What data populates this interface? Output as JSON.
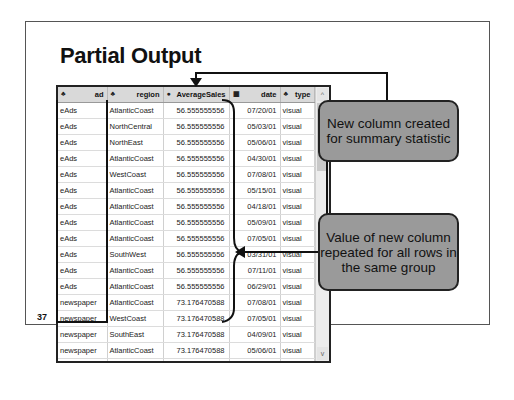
{
  "slide": {
    "title": "Partial Output",
    "page_number": "37"
  },
  "table": {
    "columns": [
      {
        "icon": "string-icon",
        "glyph": "♣",
        "label": "ad"
      },
      {
        "icon": "string-icon",
        "glyph": "♣",
        "label": "region"
      },
      {
        "icon": "numeric-icon",
        "glyph": "●",
        "label": "AverageSales"
      },
      {
        "icon": "date-icon",
        "glyph": "▦",
        "label": "date"
      },
      {
        "icon": "string-icon",
        "glyph": "♣",
        "label": "type"
      }
    ],
    "rows": [
      [
        "eAds",
        "AtlanticCoast",
        "56.555555556",
        "07/20/01",
        "visual"
      ],
      [
        "eAds",
        "NorthCentral",
        "56.555555556",
        "05/03/01",
        "visual"
      ],
      [
        "eAds",
        "NorthEast",
        "56.555555556",
        "05/06/01",
        "visual"
      ],
      [
        "eAds",
        "AtlanticCoast",
        "56.555555556",
        "04/30/01",
        "visual"
      ],
      [
        "eAds",
        "WestCoast",
        "56.555555556",
        "07/08/01",
        "visual"
      ],
      [
        "eAds",
        "AtlanticCoast",
        "56.555555556",
        "05/15/01",
        "visual"
      ],
      [
        "eAds",
        "AtlanticCoast",
        "56.555555556",
        "04/18/01",
        "visual"
      ],
      [
        "eAds",
        "AtlanticCoast",
        "56.555555556",
        "05/09/01",
        "visual"
      ],
      [
        "eAds",
        "AtlanticCoast",
        "56.555555556",
        "07/05/01",
        "visual"
      ],
      [
        "eAds",
        "SouthWest",
        "56.555555556",
        "03/31/01",
        "visual"
      ],
      [
        "eAds",
        "AtlanticCoast",
        "56.555555556",
        "07/11/01",
        "visual"
      ],
      [
        "eAds",
        "AtlanticCoast",
        "56.555555556",
        "06/29/01",
        "visual"
      ],
      [
        "newspaper",
        "AtlanticCoast",
        "73.176470588",
        "07/08/01",
        "visual"
      ],
      [
        "newspaper",
        "WestCoast",
        "73.176470588",
        "07/05/01",
        "visual"
      ],
      [
        "newspaper",
        "SouthEast",
        "73.176470588",
        "04/09/01",
        "visual"
      ],
      [
        "newspaper",
        "AtlanticCoast",
        "73.176470588",
        "05/06/01",
        "visual"
      ],
      [
        "newspaper",
        "AtlanticCoast",
        "73.176470588",
        "07/02/01",
        "visual"
      ],
      [
        "newspaper",
        "AtlanticCoast",
        "73.176470588",
        "06/29/01",
        "visual"
      ]
    ]
  },
  "scrollbar": {
    "up_glyph": "^",
    "down_glyph": "v"
  },
  "callouts": {
    "new_column": "New column created for summary statistic",
    "repeated_value": "Value of new column repeated for all rows in the same group"
  }
}
